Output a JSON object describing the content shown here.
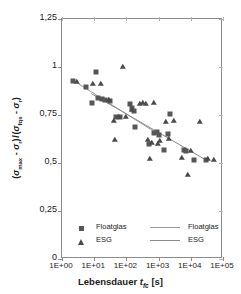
{
  "chart_data": {
    "type": "scatter",
    "title": "",
    "xlabel": "Lebensdauer t_fc [s]",
    "ylabel": "(σmax - σr) / (σfqs - σr)",
    "xscale": "log",
    "xlim": [
      1,
      100000
    ],
    "ylim": [
      0,
      1.25
    ],
    "xticks": [
      "1E+00",
      "1E+01",
      "1E+02",
      "1E+03",
      "1E+04",
      "1E+05"
    ],
    "xtick_values": [
      1,
      10,
      100,
      1000,
      10000,
      100000
    ],
    "yticks": [
      "0",
      "0,25",
      "0,5",
      "0,75",
      "1",
      "1,25"
    ],
    "ytick_values": [
      0,
      0.25,
      0.5,
      0.75,
      1,
      1.25
    ],
    "grid": false,
    "legend_position": "bottom-inside",
    "series": [
      {
        "name": "Floatglas",
        "marker": "square",
        "color": "#575757",
        "points": [
          [
            2.2,
            0.925
          ],
          [
            5.5,
            0.895
          ],
          [
            8.5,
            0.815
          ],
          [
            11.0,
            0.975
          ],
          [
            13.0,
            0.838
          ],
          [
            17.0,
            0.832
          ],
          [
            21.0,
            0.826
          ],
          [
            30.0,
            0.825
          ],
          [
            48.0,
            0.741
          ],
          [
            62.0,
            0.74
          ],
          [
            130.0,
            0.806
          ],
          [
            150.0,
            0.784
          ],
          [
            175.0,
            0.772
          ],
          [
            185.0,
            0.686
          ],
          [
            520.0,
            0.6
          ],
          [
            700.0,
            0.655
          ],
          [
            900.0,
            0.66
          ],
          [
            1050.0,
            0.648
          ],
          [
            1500.0,
            0.57
          ],
          [
            1900.0,
            0.652
          ],
          [
            2300.0,
            0.757
          ],
          [
            6000.0,
            0.566
          ],
          [
            7000.0,
            0.56
          ],
          [
            13000.0,
            0.515
          ],
          [
            30000.0,
            0.518
          ]
        ]
      },
      {
        "name": "ESG",
        "marker": "triangle",
        "color": "#4a4a4a",
        "points": [
          [
            3.0,
            0.922
          ],
          [
            9.5,
            0.91
          ],
          [
            16.0,
            0.912
          ],
          [
            28.0,
            0.828
          ],
          [
            40.0,
            0.718
          ],
          [
            45.0,
            0.62
          ],
          [
            58.0,
            0.742
          ],
          [
            80.0,
            1.0
          ],
          [
            95.0,
            0.742
          ],
          [
            150.0,
            0.775
          ],
          [
            260.0,
            0.808
          ],
          [
            330.0,
            0.81
          ],
          [
            420.0,
            0.805
          ],
          [
            480.0,
            0.618
          ],
          [
            560.0,
            0.522
          ],
          [
            620.0,
            0.605
          ],
          [
            700.0,
            0.81
          ],
          [
            950.0,
            0.6
          ],
          [
            1100.0,
            0.612
          ],
          [
            1700.0,
            0.714
          ],
          [
            2100.0,
            0.625
          ],
          [
            3000.0,
            0.718
          ],
          [
            5200.0,
            0.525
          ],
          [
            8000.0,
            0.435
          ],
          [
            10000.0,
            0.56
          ],
          [
            20000.0,
            0.713
          ],
          [
            35000.0,
            0.52
          ],
          [
            52000.0,
            0.518
          ]
        ]
      }
    ],
    "fit_lines": [
      {
        "name": "Floatglas",
        "color": "#999999",
        "x0": 2.0,
        "y0": 0.935,
        "x1": 1100.0,
        "y1": 0.645
      },
      {
        "name": "ESG",
        "color": "#8a8a8a",
        "x0": 8.0,
        "y0": 0.862,
        "x1": 30000.0,
        "y1": 0.515
      }
    ],
    "legend": [
      {
        "label": "Floatglas",
        "marker": "square",
        "line_label": "Floatglas"
      },
      {
        "label": "ESG",
        "marker": "triangle",
        "line_label": "ESG"
      }
    ]
  },
  "axis": {
    "x_title_main": "Lebensdauer",
    "x_title_var": "t",
    "x_title_sub": "fc",
    "x_title_unit": "[s]",
    "y_title_html": "ytitle"
  },
  "colors": {
    "frame": "#8c8c8c",
    "square_marker": "#575757",
    "triangle_marker": "#4a4a4a",
    "fit_line": "#999999",
    "text": "#1a1a1a",
    "background": "#ffffff"
  }
}
